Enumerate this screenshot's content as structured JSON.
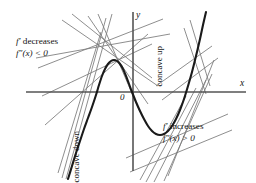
{
  "figure": {
    "kind": "calculus-concavity-diagram",
    "background_color": "#ffffff",
    "curve_color": "#1a1a1a",
    "tangent_color": "#7a7a7a",
    "axis_color": "#555555",
    "text_color": "#141414",
    "axes": {
      "x_label": "x",
      "y_label": "y",
      "origin_label": "0"
    },
    "labels": {
      "concave_down": "concave down",
      "concave_up": "concave up",
      "left_note_line1_prime": "f′",
      "left_note_line1_text": " decreases",
      "left_note_line2": "f″(x) < 0",
      "right_note_line1_prime": "f′",
      "right_note_line1_text": " increases",
      "right_note_line2": "f″(x) > 0"
    }
  },
  "chart_data": {
    "type": "line",
    "title": "",
    "xlabel": "x",
    "ylabel": "y",
    "grid": false,
    "legend": "none",
    "axis_pixels": {
      "x_axis_y": 92,
      "x_axis_x_start": 26,
      "x_axis_x_end": 246,
      "y_axis_x": 133,
      "y_axis_y_start": 12,
      "y_axis_y_end": 171
    },
    "curve": {
      "name": "f",
      "stroke_width": 2.1,
      "points": [
        [
          68,
          179
        ],
        [
          72,
          166
        ],
        [
          76,
          153
        ],
        [
          80,
          141
        ],
        [
          84,
          129
        ],
        [
          88,
          118
        ],
        [
          92,
          107
        ],
        [
          96,
          95
        ],
        [
          99,
          85
        ],
        [
          102,
          76
        ],
        [
          105,
          69
        ],
        [
          108,
          64
        ],
        [
          111,
          61
        ],
        [
          114,
          60
        ],
        [
          117,
          61
        ],
        [
          120,
          64
        ],
        [
          123,
          69
        ],
        [
          126,
          76
        ],
        [
          129,
          84
        ],
        [
          132,
          92
        ],
        [
          136,
          102
        ],
        [
          140,
          111
        ],
        [
          144,
          119
        ],
        [
          148,
          126
        ],
        [
          152,
          131
        ],
        [
          156,
          134
        ],
        [
          160,
          135
        ],
        [
          164,
          134
        ],
        [
          168,
          131
        ],
        [
          172,
          126
        ],
        [
          176,
          119
        ],
        [
          180,
          110
        ],
        [
          184,
          99
        ],
        [
          188,
          86
        ],
        [
          192,
          72
        ],
        [
          196,
          56
        ],
        [
          200,
          39
        ],
        [
          203,
          25
        ],
        [
          206,
          12
        ]
      ],
      "features": {
        "local_max_px": [
          114,
          60
        ],
        "local_min_px": [
          160,
          135
        ],
        "inflection_px": [
          137,
          103
        ]
      }
    },
    "tangent_lines": {
      "stroke_width": 0.85,
      "concave_down_region": [
        {
          "x1": 58,
          "y1": 173,
          "x2": 101,
          "y2": 32
        },
        {
          "x1": 62,
          "y1": 178,
          "x2": 106,
          "y2": 18
        },
        {
          "x1": 66,
          "y1": 179,
          "x2": 112,
          "y2": 14
        },
        {
          "x1": 45,
          "y1": 125,
          "x2": 148,
          "y2": 34
        },
        {
          "x1": 38,
          "y1": 68,
          "x2": 163,
          "y2": 19
        },
        {
          "x1": 36,
          "y1": 58,
          "x2": 170,
          "y2": 34
        },
        {
          "x1": 62,
          "y1": 20,
          "x2": 158,
          "y2": 86
        },
        {
          "x1": 72,
          "y1": 14,
          "x2": 152,
          "y2": 78
        },
        {
          "x1": 88,
          "y1": 16,
          "x2": 148,
          "y2": 104
        },
        {
          "x1": 98,
          "y1": 14,
          "x2": 140,
          "y2": 112
        },
        {
          "x1": 42,
          "y1": 96,
          "x2": 152,
          "y2": 44
        }
      ],
      "concave_up_region": [
        {
          "x1": 140,
          "y1": 180,
          "x2": 186,
          "y2": 96
        },
        {
          "x1": 146,
          "y1": 182,
          "x2": 196,
          "y2": 88
        },
        {
          "x1": 154,
          "y1": 182,
          "x2": 206,
          "y2": 80
        },
        {
          "x1": 164,
          "y1": 181,
          "x2": 212,
          "y2": 74
        },
        {
          "x1": 126,
          "y1": 158,
          "x2": 228,
          "y2": 114
        },
        {
          "x1": 130,
          "y1": 172,
          "x2": 232,
          "y2": 130
        },
        {
          "x1": 168,
          "y1": 176,
          "x2": 214,
          "y2": 60
        },
        {
          "x1": 156,
          "y1": 86,
          "x2": 212,
          "y2": 46
        },
        {
          "x1": 162,
          "y1": 100,
          "x2": 218,
          "y2": 58
        },
        {
          "x1": 184,
          "y1": 28,
          "x2": 206,
          "y2": 94
        },
        {
          "x1": 190,
          "y1": 20,
          "x2": 210,
          "y2": 86
        }
      ]
    }
  }
}
